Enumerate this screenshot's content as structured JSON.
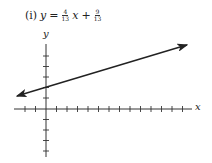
{
  "problem": {
    "label": "(i)",
    "lhs": "y",
    "equals": "=",
    "slope_num": "4",
    "slope_den": "13",
    "var": "x",
    "plus": "+",
    "intercept_num": "9",
    "intercept_den": "13"
  },
  "axes": {
    "x_label": "x",
    "y_label": "y"
  },
  "colors": {
    "ink": "#222222",
    "background": "#ffffff"
  }
}
